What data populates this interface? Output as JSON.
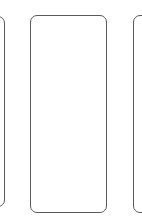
{
  "carousel": {
    "cards": [
      {
        "position": "left",
        "content": ""
      },
      {
        "position": "center",
        "content": ""
      },
      {
        "position": "right",
        "content": ""
      }
    ],
    "border_color": "#5a5a5a",
    "background_color": "#ffffff"
  }
}
